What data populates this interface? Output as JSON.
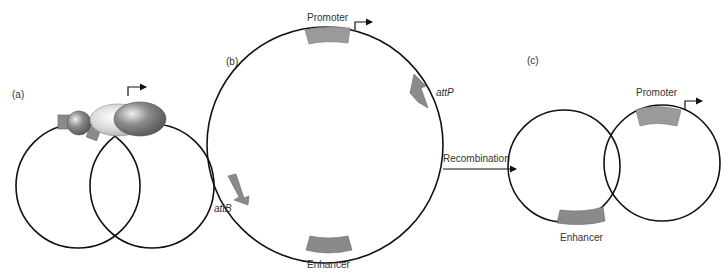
{
  "panels": {
    "a": {
      "label": "(a)"
    },
    "b": {
      "label": "(b)",
      "promoter": "Promoter",
      "enhancer": "Enhancer",
      "attP": "attP",
      "attB": "attB"
    },
    "c": {
      "label": "(c)",
      "promoter": "Promoter",
      "enhancer": "Enhancer"
    }
  },
  "arrow": {
    "label": "Recombination"
  },
  "colors": {
    "line": "#111111",
    "element_fill": "#9a9a9a",
    "element_stroke": "#777777",
    "text": "#333333"
  }
}
